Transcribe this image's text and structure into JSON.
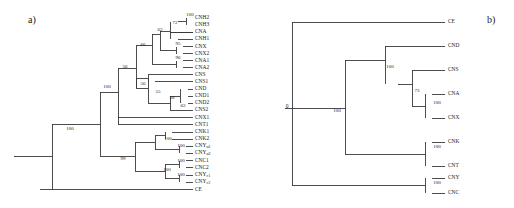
{
  "figure": {
    "width": 514,
    "height": 208,
    "background": "#ffffff",
    "line_color": "#3a3a3a",
    "text_color": "#1a1a1a"
  },
  "panels": {
    "a": {
      "label": "a)"
    },
    "b": {
      "label": "b)"
    }
  },
  "chart_data": [
    {
      "type": "tree",
      "panel": "a",
      "title": "a)",
      "description": "Phylogenetic tree (cladogram) with 24 terminal taxa and bootstrap support values at internal nodes",
      "taxa": [
        "CNH2",
        "CNH3",
        "CNA",
        "CNH1",
        "CNX",
        "CNX2",
        "CNA1",
        "CNA2",
        "CNS",
        "CNS1",
        "CND",
        "CND1",
        "CND2",
        "CNS2",
        "CNX1",
        "CNT1",
        "CNK1",
        "CNK2",
        "CNYα1",
        "CNYα2",
        "CNC1",
        "CNC2",
        "CNYε1",
        "CNYε2",
        "CE"
      ],
      "bootstrap_values": [
        100,
        72,
        62,
        66,
        95,
        96,
        56,
        56,
        55,
        58,
        62,
        100,
        100,
        100,
        100,
        99,
        100,
        100,
        100
      ],
      "newick": "((((((((CNH2,CNH3)100,CNA,CNH1)72,(CNX,CNX2)95,(CNA1,CNA2)96)62)66,((CNS,CNS1),(((CND,CND1,CND2)58,CNS2)62)55)56)56,CNX1,CNT1)100,(((CNK1,CNK2)100,(CNYα1,CNYα2)100)100,((CNC1,CNC2)100,(CNYε1,CNYε2)100)100)99)100,CE)"
    },
    {
      "type": "tree",
      "panel": "b",
      "title": "b)",
      "description": "Phylogenetic tree (cladogram) with 9 terminal taxa, root labelled 0, bootstrap support values at internal nodes",
      "taxa": [
        "CE",
        "CND",
        "CNS",
        "CNA",
        "CNX",
        "CNK",
        "CNT",
        "CNY",
        "CNC"
      ],
      "root_label": "0",
      "bootstrap_values": [
        100,
        100,
        73,
        100,
        100,
        100
      ],
      "newick": "(CE,((CND,(CNS,((CNA,CNX)100)73)100,(CNK,CNT)100)100,(CNY,CNC)100)0)"
    }
  ],
  "tree_a": {
    "taxa": [
      {
        "name": "CNH2",
        "label": "CNH2",
        "sub": "",
        "y": 18.0
      },
      {
        "name": "CNH3",
        "label": "CNH3",
        "sub": "",
        "y": 25.0
      },
      {
        "name": "CNA",
        "label": "CNA",
        "sub": "",
        "y": 32.0
      },
      {
        "name": "CNH1",
        "label": "CNH1",
        "sub": "",
        "y": 39.0
      },
      {
        "name": "CNX",
        "label": "CNX",
        "sub": "",
        "y": 46.5
      },
      {
        "name": "CNX2",
        "label": "CNX2",
        "sub": "",
        "y": 53.5
      },
      {
        "name": "CNA1",
        "label": "CNA1",
        "sub": "",
        "y": 60.5
      },
      {
        "name": "CNA2",
        "label": "CNA2",
        "sub": "",
        "y": 67.5
      },
      {
        "name": "CNS",
        "label": "CNS",
        "sub": "",
        "y": 74.5
      },
      {
        "name": "CNS1",
        "label": "CNS1",
        "sub": "",
        "y": 81.5
      },
      {
        "name": "CND",
        "label": "CND",
        "sub": "",
        "y": 89.0
      },
      {
        "name": "CND1",
        "label": "CND1",
        "sub": "",
        "y": 96.0
      },
      {
        "name": "CND2",
        "label": "CND2",
        "sub": "",
        "y": 103.0
      },
      {
        "name": "CNS2",
        "label": "CNS2",
        "sub": "",
        "y": 110.0
      },
      {
        "name": "CNX1",
        "label": "CNX1",
        "sub": "",
        "y": 117.5
      },
      {
        "name": "CNT1",
        "label": "CNT1",
        "sub": "",
        "y": 124.5
      },
      {
        "name": "CNK1",
        "label": "CNK1",
        "sub": "",
        "y": 132.0
      },
      {
        "name": "CNK2",
        "label": "CNK2",
        "sub": "",
        "y": 139.0
      },
      {
        "name": "CNYa1",
        "label": "CNY",
        "sub": "α1",
        "y": 146.0
      },
      {
        "name": "CNYa2",
        "label": "CNY",
        "sub": "α2",
        "y": 153.0
      },
      {
        "name": "CNC1",
        "label": "CNC1",
        "sub": "",
        "y": 160.5
      },
      {
        "name": "CNC2",
        "label": "CNC2",
        "sub": "",
        "y": 167.5
      },
      {
        "name": "CNYe1",
        "label": "CNY",
        "sub": "ε1",
        "y": 175.0
      },
      {
        "name": "CNYe2",
        "label": "CNY",
        "sub": "ε2",
        "y": 182.0
      },
      {
        "name": "CE",
        "label": "CE",
        "sub": "",
        "y": 189.5
      }
    ],
    "bootstraps": [
      {
        "name": "boot-100-cnh23",
        "value": "100",
        "x": 190.0,
        "y": 15.5
      },
      {
        "name": "boot-72",
        "value": "72",
        "x": 175.0,
        "y": 24.0
      },
      {
        "name": "boot-62",
        "value": "62",
        "x": 160.0,
        "y": 31.0
      },
      {
        "name": "boot-95",
        "value": "95",
        "x": 178.0,
        "y": 44.5
      },
      {
        "name": "boot-96",
        "value": "96",
        "x": 178.0,
        "y": 58.5
      },
      {
        "name": "boot-66",
        "value": "66",
        "x": 143.0,
        "y": 45.5
      },
      {
        "name": "boot-56-outer",
        "value": "56",
        "x": 125.0,
        "y": 68.0
      },
      {
        "name": "boot-56-inner",
        "value": "56",
        "x": 143.0,
        "y": 84.5
      },
      {
        "name": "boot-55",
        "value": "55",
        "x": 158.0,
        "y": 93.0
      },
      {
        "name": "boot-58",
        "value": "58",
        "x": 172.0,
        "y": 99.0
      },
      {
        "name": "boot-62-cns2",
        "value": "62",
        "x": 183.0,
        "y": 107.0
      },
      {
        "name": "boot-100-clade",
        "value": "100",
        "x": 107.0,
        "y": 88.0
      },
      {
        "name": "boot-100-cnk",
        "value": "100",
        "x": 168.0,
        "y": 140.0
      },
      {
        "name": "boot-100-cnya",
        "value": "100",
        "x": 181.0,
        "y": 147.0
      },
      {
        "name": "boot-99",
        "value": "99",
        "x": 123.0,
        "y": 160.0
      },
      {
        "name": "boot-100-cnc",
        "value": "100",
        "x": 181.0,
        "y": 161.5
      },
      {
        "name": "boot-100-lower",
        "value": "100",
        "x": 167.0,
        "y": 170.5
      },
      {
        "name": "boot-100-cnye",
        "value": "100",
        "x": 181.0,
        "y": 176.0
      },
      {
        "name": "boot-100-root",
        "value": "100",
        "x": 70.0,
        "y": 130.0
      }
    ]
  },
  "tree_b": {
    "root_label": {
      "value": "0",
      "x": 287.0,
      "y": 108.0
    },
    "taxa": [
      {
        "name": "CE",
        "label": "CE",
        "y": 22.0
      },
      {
        "name": "CND",
        "label": "CND",
        "y": 46.0
      },
      {
        "name": "CNS",
        "label": "CNS",
        "y": 70.0
      },
      {
        "name": "CNA",
        "label": "CNA",
        "y": 94.0
      },
      {
        "name": "CNX",
        "label": "CNX",
        "y": 118.0
      },
      {
        "name": "CNK",
        "label": "CNK",
        "y": 142.0
      },
      {
        "name": "CNT",
        "label": "CNT",
        "y": 166.0
      },
      {
        "name": "CNY",
        "label": "CNY",
        "y": 178.0
      },
      {
        "name": "CNC",
        "label": "CNC",
        "y": 193.0
      }
    ],
    "bootstraps": [
      {
        "name": "boot-b-100-main",
        "value": "100",
        "x": 337.0,
        "y": 112.0
      },
      {
        "name": "boot-b-100-upper",
        "value": "100",
        "x": 390.0,
        "y": 68.0
      },
      {
        "name": "boot-b-73",
        "value": "73",
        "x": 417.0,
        "y": 92.0
      },
      {
        "name": "boot-b-100-cnax",
        "value": "100",
        "x": 437.0,
        "y": 104.0
      },
      {
        "name": "boot-b-100-cnkt",
        "value": "100",
        "x": 437.0,
        "y": 148.0
      },
      {
        "name": "boot-b-100-cnyc",
        "value": "100",
        "x": 437.0,
        "y": 184.0
      }
    ]
  }
}
